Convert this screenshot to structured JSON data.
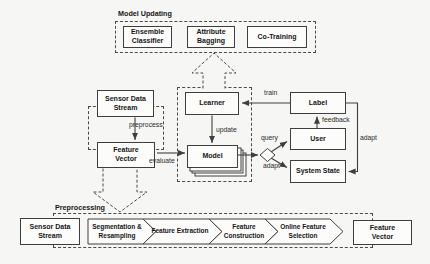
{
  "figure": {
    "top": {
      "title": "Model Updating",
      "ensemble": "Ensemble Classifier",
      "bagging": "Attribute Bagging",
      "cotraining": "Co-Training"
    },
    "mid": {
      "sensor": "Sensor Data Stream",
      "feature_vector": "Feature Vector",
      "learner": "Learner",
      "model": "Model",
      "label": "Label",
      "user": "User",
      "system_state": "System State"
    },
    "edges": {
      "preprocess": "preprocess",
      "update": "update",
      "evaluate": "evaluate",
      "train": "train",
      "feedback": "feedback",
      "query": "query",
      "adapt_lower": "adapt",
      "adapt_right": "adapt"
    },
    "bottom": {
      "title": "Preprocessing",
      "sensor": "Sensor Data Stream",
      "stages": [
        "Segmentation & Resampling",
        "Feature Extraction",
        "Feature Construction",
        "Online Feature Selection"
      ],
      "feature_vector": "Feature Vector"
    },
    "colors": {
      "stroke": "#3e3e3e",
      "text": "#1d1d1d",
      "page_bg": "#f6f6f4",
      "box_fill": "#fcfcfb"
    }
  }
}
